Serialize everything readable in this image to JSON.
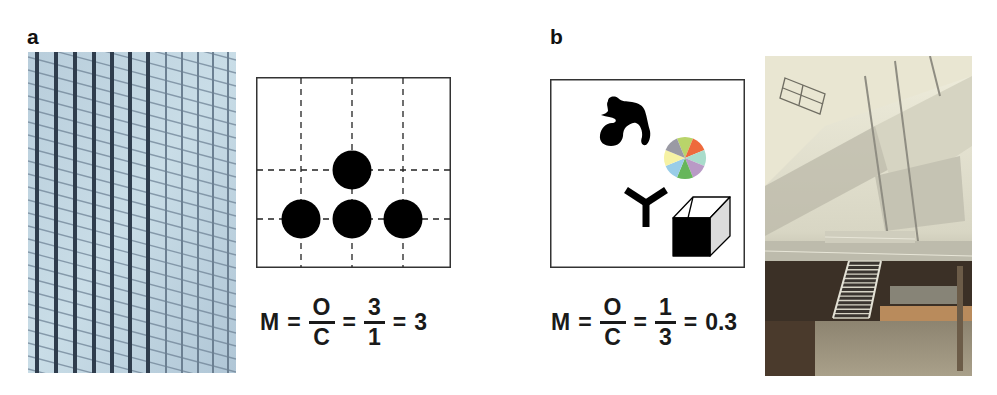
{
  "figure": {
    "panels": [
      {
        "label": "a",
        "photo": {
          "subject": "glass curtain-wall facade with regular vertical mullions",
          "palette": [
            "#c9dce6",
            "#aac3d3",
            "#3c4c5e"
          ]
        },
        "diagram": {
          "description": "3x3-ish dashed grid with four identical black circles",
          "objects": [
            {
              "shape": "circle",
              "color": "#000000",
              "grid_pos": "center-upper"
            },
            {
              "shape": "circle",
              "color": "#000000",
              "grid_pos": "left-lower"
            },
            {
              "shape": "circle",
              "color": "#000000",
              "grid_pos": "center-lower"
            },
            {
              "shape": "circle",
              "color": "#000000",
              "grid_pos": "right-lower"
            }
          ]
        },
        "equation": {
          "lhs": "M",
          "eq": "=",
          "frac1": {
            "num": "O",
            "den": "C"
          },
          "frac2": {
            "num": "3",
            "den": "1"
          },
          "result": "3"
        }
      },
      {
        "label": "b",
        "diagram": {
          "description": "four dissimilar objects, no alignment grid",
          "objects": [
            {
              "shape": "irregular-blob",
              "color": "#000000"
            },
            {
              "shape": "color-wheel",
              "colors": [
                "#b9d46a",
                "#ee6a3c",
                "#a9dccb",
                "#b99ac6",
                "#66b65a",
                "#99cde8",
                "#f6f2a4",
                "#9a9aa4"
              ]
            },
            {
              "shape": "y-shape",
              "color": "#000000"
            },
            {
              "shape": "cube",
              "front": "#000000",
              "side": "#dcdcdc",
              "top": "#ffffff"
            }
          ]
        },
        "equation": {
          "lhs": "M",
          "eq": "=",
          "frac1": {
            "num": "O",
            "den": "C"
          },
          "frac2": {
            "num": "1",
            "den": "3"
          },
          "result": "0.3"
        },
        "photo": {
          "subject": "atrium interior with staircase and balconies",
          "palette": [
            "#eae8d4",
            "#9c9a8c",
            "#3b3026",
            "#c8a070",
            "#e4d160"
          ]
        }
      }
    ]
  }
}
